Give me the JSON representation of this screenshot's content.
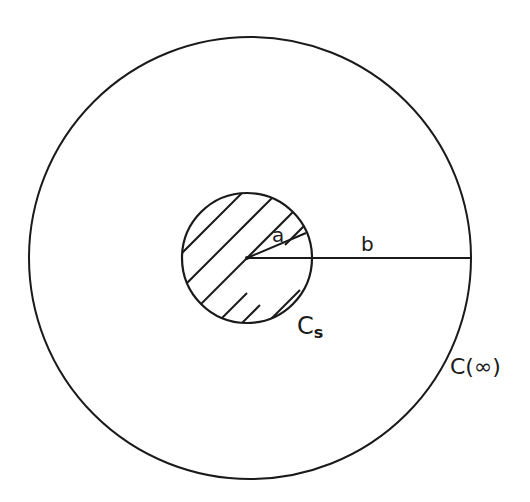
{
  "diagram": {
    "outer_circle": {
      "label": "C(∞)",
      "cx": 250,
      "cy": 258,
      "r": 221
    },
    "inner_circle": {
      "label_main": "C",
      "label_sub": "s",
      "cx": 247,
      "cy": 258,
      "r": 65,
      "fill": "hatched"
    },
    "radius_a": {
      "label": "a"
    },
    "radius_b": {
      "label": "b"
    },
    "stroke_color": "#1a1a1a",
    "background": "#ffffff"
  }
}
